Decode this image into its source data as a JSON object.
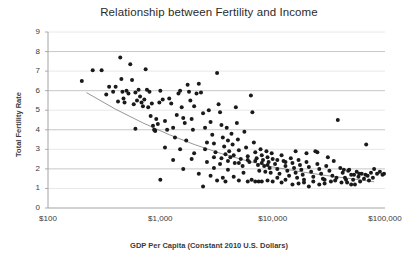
{
  "chart_data": {
    "type": "scatter",
    "title": "Relationship between Fertility and Income",
    "xlabel": "GDP Per Capita (Constant 2010 U.S. Dollars)",
    "ylabel": "Total Fertility Rate",
    "xscale": "log",
    "xlim": [
      100,
      100000
    ],
    "ylim": [
      0,
      9
    ],
    "grid": true,
    "legend": null,
    "xticks": [
      100,
      1000,
      10000,
      100000
    ],
    "xtick_labels": [
      "$100",
      "$1,000",
      "$10,000",
      "$100,000"
    ],
    "yticks": [
      0,
      1,
      2,
      3,
      4,
      5,
      6,
      7,
      8,
      9
    ],
    "ytick_labels": [
      "0",
      "1",
      "2",
      "3",
      "4",
      "5",
      "6",
      "7",
      "8",
      "9"
    ],
    "marker": {
      "shape": "circle",
      "color": "#1a1a1a",
      "size": 2.0
    },
    "trendline": {
      "present": true,
      "color": "#8a8a8a",
      "width": 0.9,
      "description": "downward logarithmic fit",
      "points": [
        [
          220,
          5.9
        ],
        [
          400,
          5.05
        ],
        [
          700,
          4.35
        ],
        [
          1200,
          3.75
        ],
        [
          2000,
          3.25
        ],
        [
          3500,
          2.78
        ],
        [
          6000,
          2.4
        ],
        [
          10000,
          2.1
        ],
        [
          18000,
          1.85
        ],
        [
          30000,
          1.66
        ],
        [
          50000,
          1.5
        ],
        [
          80000,
          1.34
        ]
      ]
    },
    "points": [
      [
        200,
        6.5
      ],
      [
        250,
        7.05
      ],
      [
        300,
        7.05
      ],
      [
        330,
        5.8
      ],
      [
        350,
        6.2
      ],
      [
        380,
        5.95
      ],
      [
        400,
        6.2
      ],
      [
        420,
        5.45
      ],
      [
        440,
        7.7
      ],
      [
        450,
        6.6
      ],
      [
        460,
        5.95
      ],
      [
        470,
        5.6
      ],
      [
        480,
        5.4
      ],
      [
        500,
        6.0
      ],
      [
        520,
        5.85
      ],
      [
        540,
        7.35
      ],
      [
        560,
        6.55
      ],
      [
        580,
        5.3
      ],
      [
        600,
        5.9
      ],
      [
        620,
        5.5
      ],
      [
        640,
        6.05
      ],
      [
        660,
        5.7
      ],
      [
        680,
        5.4
      ],
      [
        700,
        5.2
      ],
      [
        720,
        5.55
      ],
      [
        740,
        7.1
      ],
      [
        760,
        6.05
      ],
      [
        780,
        5.15
      ],
      [
        800,
        5.95
      ],
      [
        820,
        4.7
      ],
      [
        840,
        5.35
      ],
      [
        860,
        4.2
      ],
      [
        880,
        4.0
      ],
      [
        900,
        3.95
      ],
      [
        920,
        4.55
      ],
      [
        950,
        4.3
      ],
      [
        980,
        5.4
      ],
      [
        1000,
        6.0
      ],
      [
        1050,
        5.55
      ],
      [
        1100,
        4.45
      ],
      [
        1150,
        4.0
      ],
      [
        1200,
        5.6
      ],
      [
        1250,
        5.35
      ],
      [
        1300,
        4.1
      ],
      [
        1350,
        3.6
      ],
      [
        1400,
        4.75
      ],
      [
        1450,
        5.85
      ],
      [
        1500,
        6.0
      ],
      [
        1550,
        5.15
      ],
      [
        1600,
        4.6
      ],
      [
        1650,
        4.35
      ],
      [
        1700,
        3.45
      ],
      [
        1750,
        6.3
      ],
      [
        1800,
        5.95
      ],
      [
        1850,
        5.5
      ],
      [
        1900,
        4.55
      ],
      [
        1950,
        4.0
      ],
      [
        2000,
        5.2
      ],
      [
        2100,
        5.85
      ],
      [
        2200,
        6.35
      ],
      [
        2300,
        5.9
      ],
      [
        2400,
        4.85
      ],
      [
        2500,
        4.1
      ],
      [
        2600,
        3.35
      ],
      [
        2700,
        5.0
      ],
      [
        2800,
        4.4
      ],
      [
        2900,
        3.75
      ],
      [
        3000,
        3.3
      ],
      [
        3100,
        2.85
      ],
      [
        3200,
        6.9
      ],
      [
        3300,
        5.3
      ],
      [
        3400,
        4.9
      ],
      [
        3500,
        4.25
      ],
      [
        3600,
        3.6
      ],
      [
        3700,
        3.15
      ],
      [
        3800,
        2.75
      ],
      [
        3900,
        4.1
      ],
      [
        4000,
        3.45
      ],
      [
        4100,
        2.9
      ],
      [
        4200,
        2.6
      ],
      [
        4300,
        3.8
      ],
      [
        4400,
        3.25
      ],
      [
        4500,
        2.7
      ],
      [
        4600,
        2.3
      ],
      [
        4700,
        5.15
      ],
      [
        4800,
        4.35
      ],
      [
        4900,
        3.5
      ],
      [
        5000,
        2.95
      ],
      [
        5200,
        2.5
      ],
      [
        5400,
        2.15
      ],
      [
        5600,
        3.9
      ],
      [
        5800,
        3.1
      ],
      [
        6000,
        2.65
      ],
      [
        6200,
        2.35
      ],
      [
        6400,
        5.75
      ],
      [
        6600,
        4.9
      ],
      [
        6800,
        3.35
      ],
      [
        7000,
        2.85
      ],
      [
        7200,
        2.55
      ],
      [
        7400,
        2.2
      ],
      [
        7600,
        1.9
      ],
      [
        7800,
        3.0
      ],
      [
        8000,
        2.7
      ],
      [
        8200,
        2.45
      ],
      [
        8400,
        2.15
      ],
      [
        8600,
        1.85
      ],
      [
        8800,
        2.9
      ],
      [
        9000,
        2.6
      ],
      [
        9200,
        2.35
      ],
      [
        9400,
        2.05
      ],
      [
        9600,
        1.8
      ],
      [
        9800,
        2.8
      ],
      [
        10000,
        2.5
      ],
      [
        10500,
        2.25
      ],
      [
        11000,
        2.0
      ],
      [
        11500,
        1.75
      ],
      [
        12000,
        2.7
      ],
      [
        12500,
        2.4
      ],
      [
        13000,
        2.15
      ],
      [
        13500,
        1.9
      ],
      [
        14000,
        1.65
      ],
      [
        14500,
        2.55
      ],
      [
        15000,
        2.3
      ],
      [
        15500,
        2.05
      ],
      [
        16000,
        1.8
      ],
      [
        16500,
        1.55
      ],
      [
        17000,
        2.45
      ],
      [
        17500,
        2.2
      ],
      [
        18000,
        1.95
      ],
      [
        18500,
        1.7
      ],
      [
        19000,
        1.45
      ],
      [
        20000,
        2.35
      ],
      [
        21000,
        2.1
      ],
      [
        22000,
        1.85
      ],
      [
        23000,
        1.6
      ],
      [
        24000,
        2.9
      ],
      [
        25000,
        2.25
      ],
      [
        26000,
        2.0
      ],
      [
        27000,
        1.75
      ],
      [
        28000,
        1.5
      ],
      [
        29000,
        1.25
      ],
      [
        30000,
        2.15
      ],
      [
        32000,
        1.9
      ],
      [
        34000,
        1.65
      ],
      [
        36000,
        1.4
      ],
      [
        38000,
        4.5
      ],
      [
        40000,
        2.05
      ],
      [
        42000,
        1.8
      ],
      [
        44000,
        1.55
      ],
      [
        46000,
        1.3
      ],
      [
        48000,
        1.95
      ],
      [
        50000,
        1.7
      ],
      [
        52000,
        1.45
      ],
      [
        54000,
        1.2
      ],
      [
        56000,
        1.85
      ],
      [
        58000,
        1.6
      ],
      [
        60000,
        1.35
      ],
      [
        62000,
        1.75
      ],
      [
        65000,
        1.5
      ],
      [
        68000,
        3.25
      ],
      [
        70000,
        1.65
      ],
      [
        72000,
        1.4
      ],
      [
        75000,
        1.8
      ],
      [
        78000,
        1.55
      ],
      [
        80000,
        2.0
      ],
      [
        85000,
        1.75
      ],
      [
        90000,
        1.85
      ],
      [
        95000,
        1.7
      ],
      [
        98000,
        1.75
      ],
      [
        1100,
        3.1
      ],
      [
        1300,
        2.45
      ],
      [
        1600,
        2.0
      ],
      [
        1900,
        2.5
      ],
      [
        2200,
        1.75
      ],
      [
        2400,
        1.1
      ],
      [
        1000,
        1.45
      ],
      [
        2600,
        2.35
      ],
      [
        2800,
        1.65
      ],
      [
        3000,
        2.05
      ],
      [
        3200,
        1.4
      ],
      [
        3400,
        2.25
      ],
      [
        3600,
        1.55
      ],
      [
        3800,
        1.35
      ],
      [
        4000,
        1.95
      ],
      [
        4500,
        1.6
      ],
      [
        5000,
        1.4
      ],
      [
        5500,
        1.8
      ],
      [
        6000,
        1.35
      ],
      [
        6500,
        1.45
      ],
      [
        7000,
        1.35
      ],
      [
        7500,
        1.35
      ],
      [
        8000,
        1.35
      ],
      [
        9000,
        1.4
      ],
      [
        10000,
        1.35
      ],
      [
        11000,
        1.55
      ],
      [
        12000,
        1.3
      ],
      [
        13000,
        1.45
      ],
      [
        15000,
        1.2
      ],
      [
        17000,
        1.25
      ],
      [
        19000,
        1.3
      ],
      [
        21000,
        1.1
      ],
      [
        23000,
        1.35
      ],
      [
        26000,
        1.2
      ],
      [
        29000,
        1.45
      ],
      [
        33000,
        1.35
      ],
      [
        37000,
        1.55
      ],
      [
        41000,
        1.3
      ],
      [
        45000,
        1.45
      ],
      [
        50000,
        1.2
      ],
      [
        600,
        4.05
      ],
      [
        900,
        3.95
      ],
      [
        1500,
        3.0
      ],
      [
        2000,
        2.8
      ],
      [
        2500,
        3.0
      ],
      [
        3000,
        2.6
      ],
      [
        3500,
        2.55
      ],
      [
        4000,
        2.4
      ],
      [
        5000,
        2.3
      ],
      [
        6000,
        2.45
      ],
      [
        7000,
        2.4
      ],
      [
        8000,
        2.3
      ],
      [
        9000,
        2.2
      ],
      [
        11000,
        2.45
      ],
      [
        13000,
        2.35
      ],
      [
        16000,
        2.9
      ],
      [
        20000,
        2.8
      ],
      [
        25000,
        2.85
      ],
      [
        31000,
        2.6
      ],
      [
        35000,
        2.4
      ],
      [
        43000,
        1.95
      ],
      [
        47000,
        1.9
      ],
      [
        53000,
        1.7
      ],
      [
        59000,
        1.75
      ],
      [
        67000,
        1.7
      ]
    ]
  }
}
